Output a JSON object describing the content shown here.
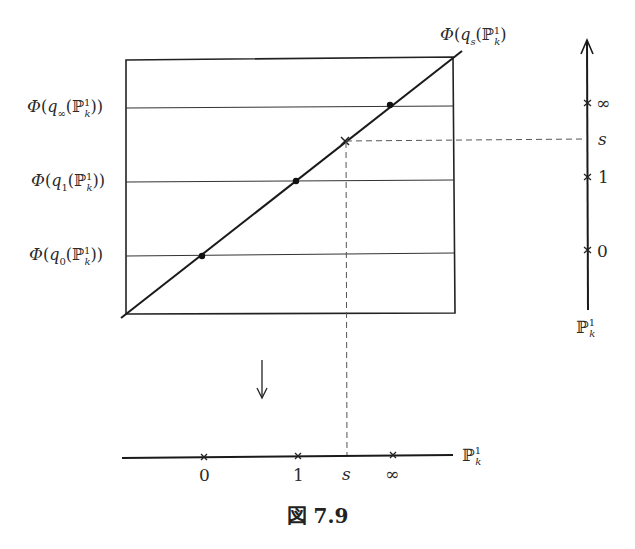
{
  "figure": {
    "caption": "図 7.9",
    "left_labels": [
      {
        "id": "q_inf",
        "phi": "Φ",
        "q": "q",
        "q_sub": "∞",
        "P": "ℙ",
        "P_sup": "1",
        "P_sub": "k",
        "y": 108
      },
      {
        "id": "q_1",
        "phi": "Φ",
        "q": "q",
        "q_sub": "1",
        "P": "ℙ",
        "P_sup": "1",
        "P_sub": "k",
        "y": 182
      },
      {
        "id": "q_0",
        "phi": "Φ",
        "q": "q",
        "q_sub": "0",
        "P": "ℙ",
        "P_sup": "1",
        "P_sub": "k",
        "y": 256
      }
    ],
    "diagonal_label": {
      "phi": "Φ",
      "q": "q",
      "q_sub": "s",
      "P": "ℙ",
      "P_sup": "1",
      "P_sub": "k"
    },
    "right_axis": {
      "label": "ℙ",
      "label_sup": "1",
      "label_sub": "k",
      "ticks": [
        {
          "label": "∞",
          "y": 103
        },
        {
          "label": "s",
          "y": 140,
          "italic": true
        },
        {
          "label": "1",
          "y": 177
        },
        {
          "label": "0",
          "y": 250
        }
      ]
    },
    "bottom_axis": {
      "label": "ℙ",
      "label_sup": "1",
      "label_sub": "k",
      "ticks": [
        {
          "label": "0",
          "x": 204
        },
        {
          "label": "1",
          "x": 298
        },
        {
          "label": "s",
          "x": 347,
          "italic": true
        },
        {
          "label": "∞",
          "x": 393
        }
      ]
    },
    "colors": {
      "line": "#1a1a1a",
      "thin": "#333333",
      "dash": "#555555",
      "text": "#2a2a2a"
    }
  }
}
